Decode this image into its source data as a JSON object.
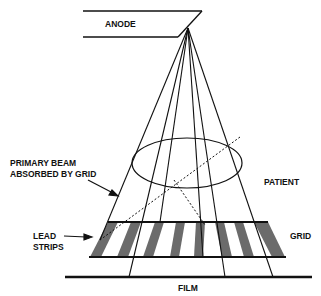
{
  "diagram": {
    "labels": {
      "anode": "ANODE",
      "primary_beam_line1": "PRIMARY BEAM",
      "primary_beam_line2": "ABSORBED BY GRID",
      "patient": "PATIENT",
      "lead_line1": "LEAD",
      "lead_line2": "STRIPS",
      "grid": "GRID",
      "film": "FILM"
    },
    "colors": {
      "line": "#111111",
      "lead_strip": "#6b6b6b",
      "background": "#ffffff"
    },
    "components": [
      "anode",
      "x-ray beam",
      "patient",
      "grid with lead strips",
      "film"
    ]
  }
}
